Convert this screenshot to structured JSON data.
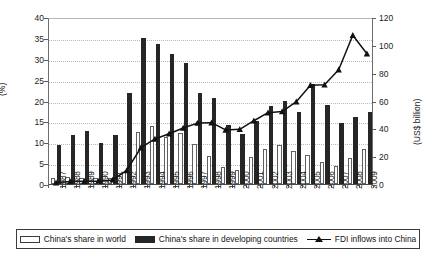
{
  "chart_data": {
    "type": "bar",
    "title": "",
    "subtitle": "",
    "xlabel": "",
    "ylabel": "(%)",
    "ylabel_secondary": "(US$ billion)",
    "grid": true,
    "legend_position": "bottom",
    "ylim": [
      0,
      40
    ],
    "ylim_secondary": [
      0,
      120
    ],
    "yticks": [
      40,
      35,
      30,
      25,
      20,
      15,
      10,
      5,
      0
    ],
    "yticks_secondary": [
      120,
      100,
      80,
      60,
      40,
      20,
      0
    ],
    "categories": [
      "1987",
      "1988",
      "1989",
      "1990",
      "1991",
      "1992",
      "1993",
      "1994",
      "1995",
      "1996",
      "1997",
      "1998",
      "1999",
      "2000",
      "2001",
      "2002",
      "2003",
      "2004",
      "2005",
      "2006",
      "2007",
      "2008",
      "2009"
    ],
    "series": [
      {
        "name": "China's share in world",
        "type": "bar",
        "axis": "left",
        "unit": "%",
        "color": "#ffffff",
        "edge_color": "#5f5f5f",
        "values": [
          1.5,
          1.6,
          1.5,
          1.4,
          1.5,
          2.9,
          12.5,
          14.0,
          11.3,
          12.2,
          9.5,
          6.6,
          4.0,
          3.3,
          6.5,
          8.5,
          9.4,
          8.0,
          7.0,
          5.3,
          4.2,
          6.3,
          8.3
        ]
      },
      {
        "name": "China's share in developing countries",
        "type": "bar",
        "axis": "left",
        "unit": "%",
        "color": "#262626",
        "values": [
          9.3,
          11.8,
          12.6,
          9.9,
          11.7,
          21.9,
          35.0,
          33.5,
          31.2,
          29.1,
          21.9,
          20.7,
          14.1,
          12.0,
          15.0,
          18.6,
          20.0,
          17.3,
          24.0,
          19.0,
          14.5,
          16.0,
          17.3
        ]
      },
      {
        "name": "FDI inflows into China",
        "type": "line",
        "axis": "right",
        "unit": "US$ billion",
        "color": "#111111",
        "marker": "triangle",
        "values": [
          2.3,
          3.2,
          3.4,
          3.5,
          4.4,
          11.2,
          27.5,
          33.8,
          37.5,
          41.7,
          45.2,
          45.5,
          40.3,
          40.7,
          46.9,
          52.7,
          53.5,
          60.6,
          72.4,
          72.7,
          83.5,
          108.3,
          95.0
        ]
      }
    ]
  },
  "legend": {
    "items": [
      {
        "label": "China's share in world",
        "swatch": "open-square-swatch"
      },
      {
        "label": "China's share in developing countries",
        "swatch": "filled-square-swatch"
      },
      {
        "label": "FDI inflows into China",
        "swatch": "line-marker-swatch"
      }
    ]
  }
}
